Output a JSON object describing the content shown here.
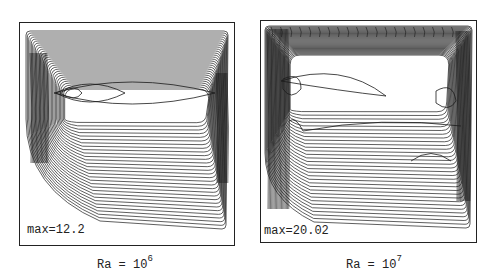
{
  "panels": [
    {
      "id": "ra-1e6",
      "max_label": "max=12.2",
      "caption_base": "Ra = 10",
      "caption_exp": "6"
    },
    {
      "id": "ra-1e7",
      "max_label": "max=20.02",
      "caption_base": "Ra = 10",
      "caption_exp": "7"
    }
  ],
  "colors": {
    "line": "#1a1a1a",
    "frame": "#222222",
    "background": "#ffffff"
  }
}
